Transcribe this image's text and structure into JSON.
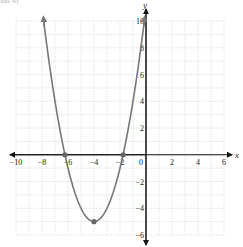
{
  "caption": "ual 4)",
  "chart_data": {
    "type": "line",
    "title": "",
    "xlabel": "x",
    "ylabel": "y",
    "xlim": [
      -10,
      6
    ],
    "ylim": [
      -6,
      10
    ],
    "grid": true,
    "grid_style": "dotted, 1-unit spacing",
    "x_ticks": [
      -10,
      -8,
      -6,
      -4,
      -2,
      0,
      2,
      4,
      6
    ],
    "y_ticks": [
      -6,
      -4,
      -2,
      2,
      4,
      6,
      8,
      10
    ],
    "x_tick_labels": [
      "−10",
      "−8",
      "−6",
      "−4",
      "−2",
      "0",
      "2",
      "4",
      "6"
    ],
    "y_tick_labels": [
      "−6",
      "−4",
      "−2",
      "2",
      "4",
      "6",
      "8",
      "10"
    ],
    "series": [
      {
        "name": "parabola",
        "equation": "y = (x + 4)^2 - 5",
        "color": "#777777",
        "x_range": [
          -7.87,
          -0.13
        ],
        "arrows_at_ends": true,
        "points": [
          {
            "x": -7.87,
            "y": 10
          },
          {
            "x": -7,
            "y": 4
          },
          {
            "x": -6.24,
            "y": 0
          },
          {
            "x": -6,
            "y": -1
          },
          {
            "x": -5,
            "y": -4
          },
          {
            "x": -4,
            "y": -5
          },
          {
            "x": -3,
            "y": -4
          },
          {
            "x": -2,
            "y": -1
          },
          {
            "x": -1.76,
            "y": 0
          },
          {
            "x": -1,
            "y": 4
          },
          {
            "x": -0.13,
            "y": 10
          }
        ]
      }
    ],
    "marked_points": [
      {
        "label": "vertex",
        "x": -4,
        "y": -5
      },
      {
        "label": "x-intercept",
        "x": -6.24,
        "y": 0
      },
      {
        "label": "x-intercept",
        "x": -1.76,
        "y": 0
      }
    ]
  }
}
